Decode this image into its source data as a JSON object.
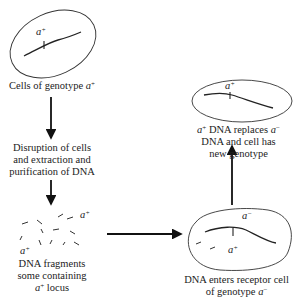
{
  "diagram": {
    "colors": {
      "line": "#2a2a2a",
      "arrow": "#111111",
      "text": "#222222"
    },
    "steps": [
      {
        "id": "donor-cells",
        "caption_prefix": "Cells of genotype ",
        "caption_allele": "a",
        "caption_sign": "+",
        "cell_allele_label": {
          "base": "a",
          "sign": "+"
        }
      },
      {
        "id": "extraction",
        "lines": [
          "Disruption of cells",
          "and extraction and",
          "purification of DNA"
        ]
      },
      {
        "id": "fragments",
        "fragment_labels": [
          {
            "base": "a",
            "sign": "+"
          },
          {
            "base": "a",
            "sign": "+"
          }
        ],
        "lines": [
          "DNA fragments",
          "some containing"
        ],
        "last_line_allele": "a",
        "last_line_sign": "+",
        "last_line_suffix": " locus"
      },
      {
        "id": "receptor-cell",
        "chromosome_label": {
          "base": "a",
          "sign": "−"
        },
        "fragment_label": {
          "base": "a",
          "sign": "+"
        },
        "line1": "DNA enters receptor cell",
        "line2_prefix": "of genotype ",
        "line2_allele": "a",
        "line2_sign": "−"
      },
      {
        "id": "transformed-cell",
        "chromosome_label": {
          "base": "a",
          "sign": "+"
        },
        "line1_allele": "a",
        "line1_sign": "+",
        "line1_mid": " DNA replaces ",
        "line1_allele2": "a",
        "line1_sign2": "−",
        "line2": "DNA and cell has",
        "line3": "new genotype"
      }
    ],
    "arrows": [
      {
        "from": "donor-cells",
        "to": "extraction",
        "direction": "down"
      },
      {
        "from": "extraction",
        "to": "fragments",
        "direction": "down"
      },
      {
        "from": "fragments",
        "to": "receptor-cell",
        "direction": "right"
      },
      {
        "from": "receptor-cell",
        "to": "transformed-cell",
        "direction": "up"
      }
    ]
  }
}
